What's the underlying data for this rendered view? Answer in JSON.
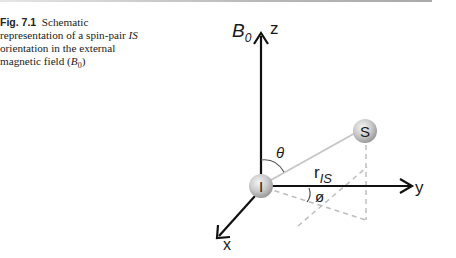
{
  "caption": {
    "label": "Fig. 7.1",
    "text_before_italic": "Schematic representation of a spin-pair ",
    "italic_term": "IS",
    "text_after_italic": " orientation in the external magnetic field (",
    "field_symbol": "B",
    "field_subscript": "0",
    "closing": ")"
  },
  "figure": {
    "field_label": "B",
    "field_subscript": "0",
    "axes": {
      "z": "z",
      "y": "y",
      "x": "x"
    },
    "spins": {
      "origin": "I",
      "partner": "S"
    },
    "distance_label": "r",
    "distance_subscript": "IS",
    "polar_angle": "θ",
    "azimuthal_angle": "ø"
  }
}
